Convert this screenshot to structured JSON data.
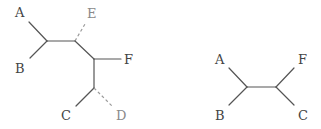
{
  "diagram": {
    "type": "phylogenetic-trees",
    "colors": {
      "solid_edge": "#555555",
      "dashed_edge": "#9a9a9a",
      "label": "#444444",
      "faded_label": "#8a8a8a"
    },
    "left_tree": {
      "labels": {
        "A": "A",
        "B": "B",
        "C": "C",
        "D": "D",
        "E": "E",
        "F": "F"
      },
      "dashed_leaves": [
        "D",
        "E"
      ]
    },
    "right_tree": {
      "labels": {
        "A": "A",
        "B": "B",
        "C": "C",
        "F": "F"
      }
    }
  }
}
